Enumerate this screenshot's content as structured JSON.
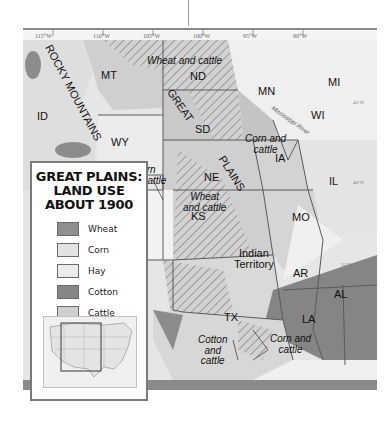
{
  "legend": {
    "title_line1": "GREAT PLAINS:",
    "title_line2": "LAND USE",
    "title_line3": "ABOUT 1900",
    "items": [
      {
        "label": "Wheat",
        "color": "#8f8f8f"
      },
      {
        "label": "Corn",
        "color": "#e2e2e2"
      },
      {
        "label": "Hay",
        "color": "#ececec"
      },
      {
        "label": "Cotton",
        "color": "#858585"
      },
      {
        "label": "Cattle",
        "color": "#cfcfcf"
      }
    ]
  },
  "longitudes": [
    "115°W",
    "110°W",
    "105°W",
    "100°W",
    "95°W",
    "90°W"
  ],
  "latitudes": [
    "45°N",
    "40°N",
    "35°N",
    "30°N"
  ],
  "states": [
    "MT",
    "ND",
    "SD",
    "NE",
    "KS",
    "CO",
    "WY",
    "ID",
    "MN",
    "WI",
    "MI",
    "IA",
    "IL",
    "MO",
    "AR",
    "LA",
    "AL",
    "TX"
  ],
  "territory": {
    "line1": "Indian",
    "line2": "Territory"
  },
  "regions": {
    "rocky_mountains": "ROCKY MOUNTAINS",
    "great": "GREAT",
    "plains": "PLAINS",
    "river": "Mississippi River"
  },
  "annotations": {
    "wheat_cattle_north": "Wheat and cattle",
    "corn_cattle_wy_1": "Corn",
    "corn_cattle_wy_2": "and cattle",
    "corn_cattle_ia_1": "Corn and",
    "corn_cattle_ia_2": "cattle",
    "wheat_cattle_ks_1": "Wheat",
    "wheat_cattle_ks_2": "and cattle",
    "cotton_cattle_1": "Cotton",
    "cotton_cattle_2": "and",
    "cotton_cattle_3": "cattle",
    "corn_cattle_tx_1": "Corn and",
    "corn_cattle_tx_2": "cattle"
  },
  "colors": {
    "wheat": "#8f8f8f",
    "corn": "#e2e2e2",
    "hay": "#ececec",
    "cotton": "#858585",
    "cattle": "#cfcfcf",
    "border": "#5a5a5a"
  }
}
